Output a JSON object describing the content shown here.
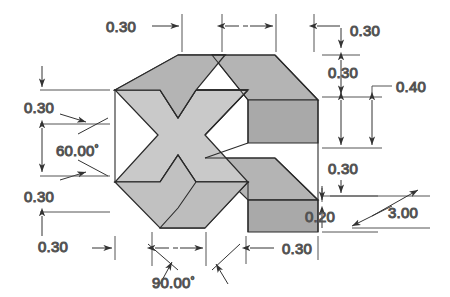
{
  "drawing": {
    "title": "Isometric cross-shaped prism dimensioned drawing",
    "view_type": "isometric",
    "colors": {
      "background": "#ffffff",
      "face_front": "#c9c9c9",
      "face_top": "#b4b4b4",
      "face_side": "#a9a9a9",
      "outline": "#2b2b2b",
      "dimension_line": "#555555",
      "dimension_text": "#3a3a3a"
    },
    "dimensions": [
      {
        "id": "top-left-width",
        "value": "0.30",
        "kind": "linear",
        "position": "top-left"
      },
      {
        "id": "top-center-width",
        "value": "",
        "kind": "linear",
        "position": "top-center"
      },
      {
        "id": "top-right-width",
        "value": "0.30",
        "kind": "linear",
        "position": "top-right"
      },
      {
        "id": "right-upper-height",
        "value": "0.30",
        "kind": "linear",
        "position": "right-upper"
      },
      {
        "id": "right-outer-height",
        "value": "0.40",
        "kind": "linear",
        "position": "right-outer"
      },
      {
        "id": "right-lower-height",
        "value": "0.30",
        "kind": "linear",
        "position": "right-lower"
      },
      {
        "id": "right-bottom-offset",
        "value": "0.20",
        "kind": "linear",
        "position": "right-bottom"
      },
      {
        "id": "depth",
        "value": "3.00",
        "kind": "linear",
        "position": "right-depth"
      },
      {
        "id": "left-upper-height",
        "value": "0.30",
        "kind": "linear",
        "position": "left-upper"
      },
      {
        "id": "left-angle",
        "value": "60.00",
        "kind": "angular",
        "unit": "deg",
        "position": "left-middle"
      },
      {
        "id": "left-lower-height",
        "value": "0.30",
        "kind": "linear",
        "position": "left-lower"
      },
      {
        "id": "left-bottom-height",
        "value": "0.30",
        "kind": "linear",
        "position": "left-bottom"
      },
      {
        "id": "bottom-angle",
        "value": "90.00",
        "kind": "angular",
        "unit": "deg",
        "position": "bottom-center"
      },
      {
        "id": "bottom-right-width",
        "value": "0.30",
        "kind": "linear",
        "position": "bottom-right"
      }
    ],
    "labels": {
      "top_left_030": "0.30",
      "top_right_030": "0.30",
      "right_upper_030": "0.30",
      "right_040": "0.40",
      "right_lower_030": "0.30",
      "right_020": "0.20",
      "depth_300": "3.00",
      "left_upper_030": "0.30",
      "left_angle_60": "60.00",
      "left_lower_030": "0.30",
      "left_bottom_030": "0.30",
      "bottom_angle_90": "90.00",
      "bottom_right_030": "0.30",
      "degree_symbol": "°"
    }
  }
}
